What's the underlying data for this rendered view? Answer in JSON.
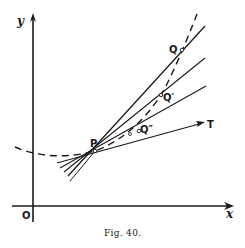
{
  "figure": {
    "caption": "Fig. 40.",
    "axes": {
      "x_label": "x",
      "y_label": "y",
      "origin_label": "O"
    },
    "points": {
      "P": {
        "label": "P",
        "x": 95,
        "y": 151
      },
      "Q": {
        "label": "Q",
        "x": 182,
        "y": 50
      },
      "Q1": {
        "label": "Q′",
        "x": 161,
        "y": 95
      },
      "Q2": {
        "label": "Q″",
        "x": 139,
        "y": 131
      }
    },
    "tangent_label": "T",
    "colors": {
      "ink": "#1a1a1a",
      "background": "#ffffff"
    }
  }
}
